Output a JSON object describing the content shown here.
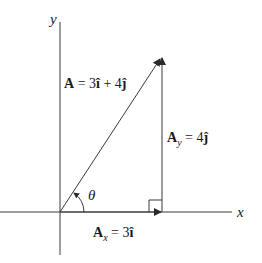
{
  "diagram": {
    "axes": {
      "x_label": "x",
      "y_label": "y"
    },
    "vector_a": {
      "label_bold": "A",
      "label_eq": " = 3",
      "i_hat": "î",
      "plus": " + 4",
      "j_hat": "ĵ"
    },
    "component_y": {
      "label_bold": "A",
      "subscript": "y",
      "label_eq": " = 4",
      "j_hat": "ĵ"
    },
    "component_x": {
      "label_bold": "A",
      "subscript": "x",
      "label_eq": " = 3",
      "i_hat": "î"
    },
    "angle_label": "θ",
    "colors": {
      "line": "#3a3a3a",
      "text": "#1a1a1a",
      "background": "#ffffff"
    }
  }
}
